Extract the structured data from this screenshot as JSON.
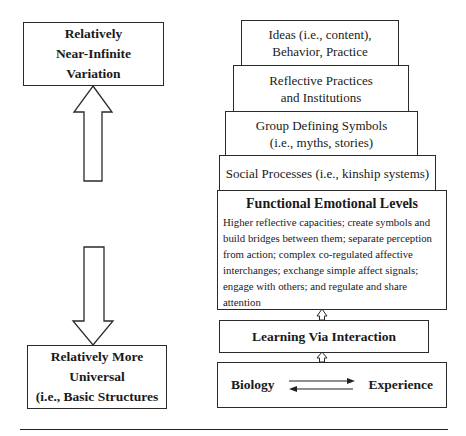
{
  "left": {
    "top_box": {
      "lines": [
        "Relatively",
        "Near-Infinite",
        "Variation"
      ]
    },
    "bottom_box": {
      "lines": [
        "Relatively More",
        "Universal",
        "(i.e., Basic Structures"
      ]
    }
  },
  "stack": [
    {
      "lines": [
        "Ideas (i.e., content),",
        "Behavior, Practice"
      ]
    },
    {
      "lines": [
        "Reflective Practices",
        "and Institutions"
      ]
    },
    {
      "lines": [
        "Group Defining Symbols",
        "(i.e., myths, stories)"
      ]
    },
    {
      "lines": [
        "Social Processes (i.e., kinship systems)"
      ]
    }
  ],
  "functional_emotional_levels": {
    "title": "Functional Emotional Levels",
    "body": "Higher reflective capacities; create symbols and build bridges between them; separate perception from action; complex co-regulated affective interchanges; exchange simple affect signals; engage with others; and regulate and share attention"
  },
  "learning_box": {
    "label": "Learning Via Interaction"
  },
  "bottom_box": {
    "left": "Biology",
    "right": "Experience"
  }
}
